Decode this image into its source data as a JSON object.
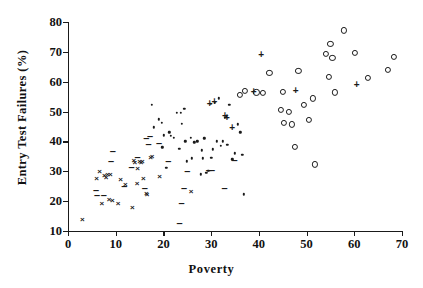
{
  "chart_data": {
    "type": "scatter",
    "title": "",
    "xlabel": "Poverty",
    "ylabel": "Entry Test Failures (%)",
    "xlim": [
      0,
      70
    ],
    "ylim": [
      10,
      80
    ],
    "xticks": [
      0,
      10,
      20,
      30,
      40,
      50,
      60,
      70
    ],
    "yticks": [
      10,
      20,
      30,
      40,
      50,
      60,
      70,
      80
    ],
    "grid": false,
    "legend": "none",
    "series": [
      {
        "name": "cross",
        "marker": "x",
        "points": [
          [
            3.0,
            13.8
          ],
          [
            6.0,
            27.4
          ],
          [
            6.6,
            29.9
          ],
          [
            7.1,
            19.2
          ],
          [
            7.6,
            28.3
          ],
          [
            8.0,
            27.7
          ],
          [
            8.3,
            28.9
          ],
          [
            8.6,
            20.4
          ],
          [
            8.9,
            28.6
          ],
          [
            9.3,
            20.0
          ],
          [
            10.5,
            19.0
          ],
          [
            11.0,
            27.1
          ],
          [
            12.0,
            25.3
          ],
          [
            13.5,
            17.6
          ],
          [
            13.8,
            33.3
          ],
          [
            14.0,
            32.8
          ],
          [
            14.5,
            25.6
          ],
          [
            14.6,
            30.6
          ],
          [
            15.0,
            33.1
          ],
          [
            15.3,
            32.9
          ],
          [
            15.6,
            33.2
          ],
          [
            15.8,
            27.4
          ],
          [
            16.4,
            22.4
          ],
          [
            16.6,
            22.0
          ],
          [
            17.3,
            34.6
          ],
          [
            17.6,
            34.8
          ],
          [
            19.2,
            28.1
          ],
          [
            25.8,
            23.1
          ],
          [
            33.2,
            48.2
          ]
        ]
      },
      {
        "name": "dash",
        "marker": "-",
        "points": [
          [
            5.9,
            23.8
          ],
          [
            6.1,
            22.2
          ],
          [
            7.5,
            21.9
          ],
          [
            9.0,
            33.6
          ],
          [
            9.4,
            36.9
          ],
          [
            11.8,
            25.2
          ],
          [
            13.3,
            31.5
          ],
          [
            14.6,
            34.9
          ],
          [
            16.1,
            24.3
          ],
          [
            16.9,
            39.3
          ],
          [
            17.2,
            41.9
          ],
          [
            19.1,
            39.6
          ],
          [
            23.4,
            12.8
          ],
          [
            23.8,
            19.4
          ],
          [
            24.3,
            24.4
          ],
          [
            25.0,
            30.0
          ],
          [
            29.5,
            30.3
          ],
          [
            30.2,
            30.4
          ],
          [
            32.8,
            24.4
          ],
          [
            34.9,
            33.8
          ],
          [
            21.0,
            33.6
          ],
          [
            16.4,
            41.3
          ]
        ]
      },
      {
        "name": "dot",
        "marker": ".",
        "points": [
          [
            17.6,
            52.3
          ],
          [
            18.0,
            44.7
          ],
          [
            19.0,
            47.4
          ],
          [
            19.6,
            46.3
          ],
          [
            20.1,
            42.0
          ],
          [
            20.6,
            31.2
          ],
          [
            21.5,
            41.8
          ],
          [
            22.2,
            41.2
          ],
          [
            22.8,
            49.6
          ],
          [
            23.3,
            37.6
          ],
          [
            23.6,
            49.5
          ],
          [
            23.9,
            46.0
          ],
          [
            24.4,
            51.0
          ],
          [
            24.6,
            40.1
          ],
          [
            24.9,
            33.4
          ],
          [
            25.8,
            41.3
          ],
          [
            26.5,
            39.7
          ],
          [
            27.1,
            40.0
          ],
          [
            27.8,
            29.0
          ],
          [
            28.1,
            37.0
          ],
          [
            28.6,
            41.0
          ],
          [
            29.0,
            29.5
          ],
          [
            29.4,
            30.2
          ],
          [
            29.9,
            52.6
          ],
          [
            30.3,
            37.3
          ],
          [
            30.8,
            53.0
          ],
          [
            31.2,
            40.0
          ],
          [
            31.6,
            54.5
          ],
          [
            32.0,
            38.5
          ],
          [
            32.5,
            40.0
          ],
          [
            32.8,
            47.9
          ],
          [
            33.4,
            38.9
          ],
          [
            33.8,
            52.3
          ],
          [
            34.4,
            34.0
          ],
          [
            34.9,
            36.0
          ],
          [
            35.6,
            45.8
          ],
          [
            36.1,
            43.1
          ],
          [
            36.5,
            35.5
          ],
          [
            36.9,
            22.3
          ],
          [
            21.2,
            43.0
          ],
          [
            26.0,
            34.4
          ],
          [
            28.3,
            34.4
          ],
          [
            30.0,
            34.5
          ],
          [
            19.8,
            38.0
          ]
        ]
      },
      {
        "name": "plus",
        "marker": "+",
        "points": [
          [
            29.7,
            52.6
          ],
          [
            30.7,
            53.3
          ],
          [
            32.9,
            48.5
          ],
          [
            33.3,
            48.0
          ],
          [
            34.4,
            44.5
          ],
          [
            38.9,
            56.5
          ],
          [
            40.5,
            68.8
          ],
          [
            47.7,
            57.0
          ],
          [
            60.5,
            58.8
          ]
        ]
      },
      {
        "name": "circle",
        "marker": "o",
        "points": [
          [
            36.0,
            55.7
          ],
          [
            37.1,
            57.0
          ],
          [
            39.5,
            56.4
          ],
          [
            40.8,
            56.2
          ],
          [
            42.2,
            62.9
          ],
          [
            44.6,
            50.6
          ],
          [
            45.0,
            56.6
          ],
          [
            45.2,
            46.2
          ],
          [
            46.3,
            49.9
          ],
          [
            47.0,
            45.7
          ],
          [
            47.5,
            38.1
          ],
          [
            48.3,
            63.7
          ],
          [
            49.4,
            52.3
          ],
          [
            50.5,
            47.2
          ],
          [
            51.3,
            54.4
          ],
          [
            51.8,
            32.3
          ],
          [
            54.0,
            69.2
          ],
          [
            54.6,
            61.6
          ],
          [
            55.0,
            72.7
          ],
          [
            55.4,
            67.9
          ],
          [
            56.0,
            56.4
          ],
          [
            57.9,
            77.2
          ],
          [
            60.2,
            69.7
          ],
          [
            62.8,
            61.2
          ],
          [
            67.0,
            64.0
          ],
          [
            68.3,
            68.2
          ]
        ]
      }
    ]
  }
}
